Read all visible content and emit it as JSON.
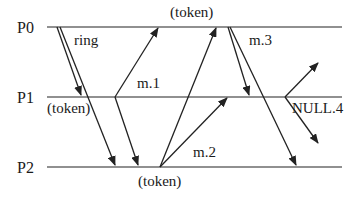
{
  "processes": [
    {
      "label": "P0",
      "y": 27
    },
    {
      "label": "P1",
      "y": 97
    },
    {
      "label": "P2",
      "y": 167
    }
  ],
  "labels": {
    "ring": "ring",
    "m1": "m.1",
    "m2": "m.2",
    "m3": "m.3",
    "null4": "NULL.4",
    "token_p0": "(token)",
    "token_p1": "(token)",
    "token_p2": "(token)"
  },
  "messages": [
    {
      "name": "ring-to-p1",
      "from": [
        57,
        27
      ],
      "to": [
        81,
        95
      ]
    },
    {
      "name": "ring-to-p2",
      "from": [
        60,
        27
      ],
      "to": [
        115,
        165
      ]
    },
    {
      "name": "m1-to-p0",
      "from": [
        115,
        97
      ],
      "to": [
        158,
        28
      ]
    },
    {
      "name": "m1-to-p2",
      "from": [
        115,
        97
      ],
      "to": [
        138,
        165
      ]
    },
    {
      "name": "token-p2-to-p0",
      "from": [
        160,
        167
      ],
      "to": [
        216,
        28
      ]
    },
    {
      "name": "m2-to-p1",
      "from": [
        160,
        167
      ],
      "to": [
        227,
        98
      ]
    },
    {
      "name": "m3-to-p1",
      "from": [
        228,
        27
      ],
      "to": [
        249,
        95
      ]
    },
    {
      "name": "m3-to-p2",
      "from": [
        230,
        27
      ],
      "to": [
        296,
        165
      ]
    },
    {
      "name": "null4-up",
      "from": [
        285,
        97
      ],
      "to": [
        318,
        63
      ]
    },
    {
      "name": "null4-down",
      "from": [
        285,
        97
      ],
      "to": [
        318,
        143
      ]
    }
  ]
}
